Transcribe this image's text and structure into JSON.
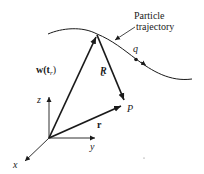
{
  "diagram": {
    "trajectory_label_line1": "Particle",
    "trajectory_label_line2": "trajectory",
    "charge_label": "q",
    "w_label_main": "w(t",
    "w_label_sub": "r",
    "w_label_close": ")",
    "script_r_label": "⭒",
    "script_r_text": "г",
    "separation_label": "'r'",
    "point_label": "P",
    "position_label": "r",
    "axis_z": "z",
    "axis_y": "y",
    "axis_x": "x",
    "colors": {
      "ink": "#1a1a1a",
      "background": "#ffffff"
    }
  }
}
